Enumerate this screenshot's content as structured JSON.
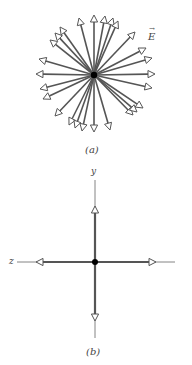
{
  "diagram_a": {
    "caption": "(a)",
    "field_label": "E",
    "field_label_vector_mark": "→",
    "center": [
      94,
      75
    ],
    "arrow_color": "#555555",
    "charge_color": "#000000",
    "arrow_tips": [
      [
        94,
        15
      ],
      [
        79,
        18
      ],
      [
        105,
        16
      ],
      [
        113,
        18
      ],
      [
        118,
        21
      ],
      [
        135,
        32
      ],
      [
        60,
        27
      ],
      [
        55,
        33
      ],
      [
        50,
        40
      ],
      [
        39,
        59
      ],
      [
        36,
        74
      ],
      [
        40,
        89
      ],
      [
        43,
        99
      ],
      [
        55,
        116
      ],
      [
        69,
        125
      ],
      [
        75,
        128
      ],
      [
        82,
        131
      ],
      [
        94,
        132
      ],
      [
        110,
        130
      ],
      [
        133,
        115
      ],
      [
        137,
        112
      ],
      [
        143,
        108
      ],
      [
        152,
        88
      ],
      [
        155,
        74
      ],
      [
        152,
        58
      ],
      [
        146,
        48
      ]
    ]
  },
  "diagram_b": {
    "caption": "(b)",
    "axis_y_label": "y",
    "axis_z_label": "z",
    "center": [
      95,
      262
    ],
    "arrow_color": "#555555",
    "arrow_tips": [
      [
        95,
        206
      ],
      [
        95,
        321
      ],
      [
        36,
        262
      ],
      [
        156,
        262
      ]
    ],
    "axis_ends": {
      "top": [
        95,
        180
      ],
      "bottom": [
        95,
        338
      ],
      "left": [
        17,
        262
      ],
      "right": [
        175,
        262
      ]
    }
  }
}
